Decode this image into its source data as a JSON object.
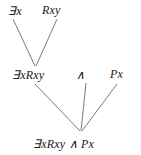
{
  "diagram": {
    "type": "parse-tree",
    "background_color": "#ffffff",
    "line_color": "#6b6b6b",
    "text_color": "#1a1a1a",
    "nodes": [
      {
        "id": "exists-x",
        "label": "∃x",
        "quantifier": "∃",
        "variable": "x",
        "row": "top",
        "x": 18,
        "y": 11
      },
      {
        "id": "rxy",
        "label": "Rxy",
        "predicate": "R",
        "arguments": "xy",
        "row": "top",
        "x": 55,
        "y": 10
      },
      {
        "id": "exists-rxy",
        "label": "∃xRxy",
        "row": "middle",
        "x": 35,
        "y": 75
      },
      {
        "id": "and",
        "label": "∧",
        "connective": "conjunction",
        "row": "middle",
        "x": 81,
        "y": 75
      },
      {
        "id": "px",
        "label": "Px",
        "predicate": "P",
        "arguments": "x",
        "row": "middle",
        "x": 120,
        "y": 74
      },
      {
        "id": "formula",
        "label": "∃xRxy ∧ Px",
        "row": "bottom",
        "x": 81,
        "y": 144
      }
    ],
    "edges": [
      {
        "id": "edge-existsx-to-existsrxy",
        "from": "exists-x",
        "to": "exists-rxy",
        "x1": 13,
        "y1": 19,
        "x2": 35,
        "y2": 66
      },
      {
        "id": "edge-rxy-to-existsrxy",
        "from": "rxy",
        "to": "exists-rxy",
        "x1": 57,
        "y1": 19,
        "x2": 36,
        "y2": 66
      },
      {
        "id": "edge-existsrxy-to-formula",
        "from": "exists-rxy",
        "to": "formula",
        "x1": 35,
        "y1": 84,
        "x2": 80,
        "y2": 131
      },
      {
        "id": "edge-and-to-formula",
        "from": "and",
        "to": "formula",
        "x1": 86,
        "y1": 83,
        "x2": 81,
        "y2": 131
      },
      {
        "id": "edge-px-to-formula",
        "from": "px",
        "to": "formula",
        "x1": 117,
        "y1": 84,
        "x2": 82,
        "y2": 131
      }
    ]
  }
}
